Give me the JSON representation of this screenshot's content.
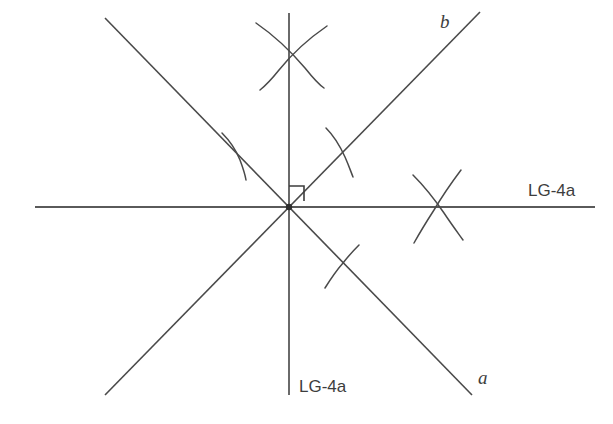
{
  "figure": {
    "type": "geometric-construction",
    "title": "",
    "background_color": "#ffffff",
    "line_color": "#4a4a4a",
    "canvas": {
      "width": 613,
      "height": 424
    },
    "vertex": {
      "x": 289,
      "y": 207,
      "label": ""
    },
    "labels": {
      "line_a": "a",
      "line_b": "b",
      "horizontal_right": "LG-4a",
      "vertical_bottom": "LG-4a"
    },
    "lines": [
      {
        "name": "horizontal-line",
        "semantic": "given-horizontal-line",
        "x1": 35,
        "y1": 207,
        "x2": 595,
        "y2": 207,
        "label": "LG-4a",
        "label_x": 528,
        "label_y": 196
      },
      {
        "name": "vertical-line",
        "semantic": "perpendicular-bisector-vertical",
        "x1": 289,
        "y1": 13,
        "x2": 289,
        "y2": 395,
        "label": "LG-4a",
        "label_x": 299,
        "label_y": 392
      },
      {
        "name": "line-a",
        "semantic": "oblique-line-a-descending",
        "x1": 105,
        "y1": 18,
        "x2": 472,
        "y2": 395,
        "label": "a",
        "label_x": 478,
        "label_y": 384
      },
      {
        "name": "line-b",
        "semantic": "oblique-line-b-ascending",
        "x1": 105,
        "y1": 395,
        "x2": 480,
        "y2": 12,
        "label": "b",
        "label_x": 440,
        "label_y": 28
      }
    ],
    "right_angle_mark": {
      "name": "right-angle-square",
      "size": 15,
      "corner_x": 289,
      "corner_y": 207,
      "between": [
        "vertical-line",
        "line-b"
      ]
    },
    "compass_arc_groups": [
      {
        "name": "arc-pair-top",
        "crossing_x": 289,
        "crossing_y": 52,
        "count": 2,
        "on_line": "vertical-line"
      },
      {
        "name": "arc-pair-right",
        "crossing_x": 440,
        "crossing_y": 207,
        "count": 2,
        "on_line": "horizontal-line"
      },
      {
        "name": "arc-upper-left",
        "crossing_x": 238,
        "crossing_y": 152,
        "count": 1,
        "on_line": "line-a"
      },
      {
        "name": "arc-upper-right",
        "crossing_x": 338,
        "crossing_y": 150,
        "count": 1,
        "on_line": "line-b"
      },
      {
        "name": "arc-lower-right",
        "crossing_x": 340,
        "crossing_y": 265,
        "count": 1,
        "on_line": "line-a"
      }
    ]
  }
}
